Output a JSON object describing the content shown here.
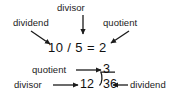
{
  "diagram": {
    "ink_color": "#1b1b1b",
    "background_color": "#ffffff",
    "top_example": {
      "expression": "10 / 5 = 2",
      "dividend_value": "10",
      "divisor_value": "5",
      "quotient_value": "2",
      "labels": {
        "dividend": "dividend",
        "divisor": "divisor",
        "quotient": "quotient"
      },
      "arrows": [
        {
          "name": "dividend-arrow",
          "from": "dividend",
          "to": "10",
          "direction": "down-right"
        },
        {
          "name": "divisor-arrow",
          "from": "divisor",
          "to": "/",
          "direction": "down"
        },
        {
          "name": "quotient-arrow",
          "from": "quotient",
          "to": "2",
          "direction": "down-left"
        }
      ]
    },
    "bottom_example": {
      "notation": "long-division",
      "quotient_value": "3",
      "divisor_value": "12",
      "dividend_value": "36",
      "labels": {
        "quotient": "quotient",
        "divisor": "divisor",
        "dividend": "dividend"
      },
      "arrows": [
        {
          "name": "quotient-arrow",
          "from": "quotient",
          "to": "3",
          "direction": "right"
        },
        {
          "name": "divisor-arrow",
          "from": "divisor",
          "to": "12",
          "direction": "right"
        },
        {
          "name": "dividend-arrow",
          "from": "dividend",
          "to": "36",
          "direction": "left"
        }
      ]
    }
  }
}
